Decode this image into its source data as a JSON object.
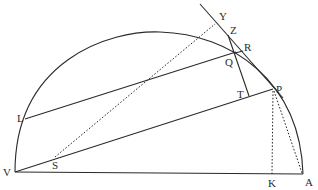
{
  "diagram": {
    "type": "geometric-construction",
    "labels": {
      "V": "V",
      "A": "A",
      "K": "K",
      "P": "P",
      "T": "T",
      "L": "L",
      "Q": "Q",
      "R": "R",
      "Z": "Z",
      "Y": "Y",
      "S": "S"
    },
    "colors": {
      "stroke": "#2a2a2a",
      "background": "#ffffff"
    }
  }
}
